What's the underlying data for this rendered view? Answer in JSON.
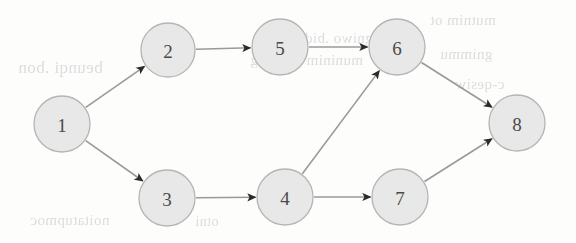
{
  "figure": {
    "type": "directed-graph",
    "caption": "",
    "background_color": "#fdfdfc",
    "node_fill_color": "#e8e8e8",
    "node_stroke_color": "#b5b5b5",
    "edge_color": "#9a9a9a",
    "arrow_color": "#2b2b2b",
    "label_color": "#4a4a4a"
  },
  "graph": {
    "nodes": [
      {
        "id": "1",
        "label": "1",
        "cx": 62,
        "cy": 124,
        "r": 28
      },
      {
        "id": "2",
        "label": "2",
        "cx": 168,
        "cy": 50,
        "r": 27
      },
      {
        "id": "3",
        "label": "3",
        "cx": 167,
        "cy": 198,
        "r": 28
      },
      {
        "id": "4",
        "label": "4",
        "cx": 285,
        "cy": 197,
        "r": 28
      },
      {
        "id": "5",
        "label": "5",
        "cx": 280,
        "cy": 47,
        "r": 28
      },
      {
        "id": "6",
        "label": "6",
        "cx": 397,
        "cy": 47,
        "r": 28
      },
      {
        "id": "7",
        "label": "7",
        "cx": 400,
        "cy": 197,
        "r": 28
      },
      {
        "id": "8",
        "label": "8",
        "cx": 517,
        "cy": 123,
        "r": 28
      }
    ],
    "edges": [
      {
        "from": "1",
        "to": "2",
        "directed": true
      },
      {
        "from": "1",
        "to": "3",
        "directed": true
      },
      {
        "from": "2",
        "to": "5",
        "directed": true
      },
      {
        "from": "5",
        "to": "6",
        "directed": true
      },
      {
        "from": "3",
        "to": "4",
        "directed": true
      },
      {
        "from": "4",
        "to": "6",
        "directed": true
      },
      {
        "from": "4",
        "to": "7",
        "directed": true
      },
      {
        "from": "6",
        "to": "8",
        "directed": true
      },
      {
        "from": "7",
        "to": "8",
        "directed": true
      }
    ]
  },
  "bleed_through": [
    {
      "text": "beunqi .bon",
      "x": 18,
      "y": 58,
      "size": 17
    },
    {
      "text": "gniwo .bidt",
      "x": 300,
      "y": 30,
      "size": 15
    },
    {
      "text": "muninim a gnivig",
      "x": 250,
      "y": 52,
      "size": 15
    },
    {
      "text": "mutnim ot",
      "x": 430,
      "y": 12,
      "size": 15
    },
    {
      "text": "gnimmu",
      "x": 440,
      "y": 46,
      "size": 15
    },
    {
      "text": "c-qesiw",
      "x": 455,
      "y": 76,
      "size": 15
    },
    {
      "text": "noitatupmoc",
      "x": 30,
      "y": 212,
      "size": 15
    },
    {
      "text": "otni",
      "x": 195,
      "y": 214,
      "size": 14
    }
  ]
}
